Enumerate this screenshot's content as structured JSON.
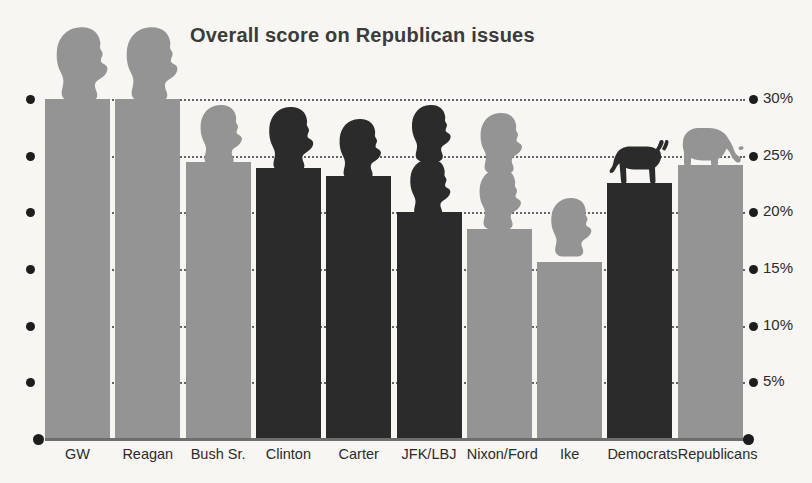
{
  "chart_data": {
    "type": "bar",
    "title": "Overall score on Republican issues",
    "xlabel": "",
    "ylabel": "",
    "ylim": [
      0,
      30
    ],
    "grid": true,
    "legend": "none",
    "ytick_labels": [
      "30%",
      "25%",
      "20%",
      "15%",
      "10%",
      "5%"
    ],
    "ytick_values": [
      30,
      25,
      20,
      15,
      10,
      5
    ],
    "categories": [
      "GW",
      "Reagan",
      "Bush Sr.",
      "Clinton",
      "Carter",
      "JFK/LBJ",
      "Nixon/Ford",
      "Ike",
      "Democrats",
      "Republicans"
    ],
    "values": [
      30.0,
      30.0,
      24.4,
      23.9,
      23.2,
      20.0,
      18.5,
      15.6,
      22.6,
      24.2
    ],
    "series": [
      {
        "name": "Overall score on Republican issues",
        "values": [
          30.0,
          30.0,
          24.4,
          23.9,
          23.2,
          20.0,
          18.5,
          15.6,
          22.6,
          24.2
        ]
      }
    ],
    "party_colors": [
      "republican",
      "republican",
      "republican",
      "democrat",
      "democrat",
      "democrat",
      "republican",
      "republican",
      "democrat",
      "republican"
    ],
    "colors": {
      "republican_bar": "#949494",
      "democrat_bar": "#2b2b2b",
      "background": "#f8f6f3",
      "title": "#3b3b3b",
      "axis": "#1d1d1d",
      "gridline": "#4a4a4a"
    },
    "annotations": [
      {
        "label": "GW presidential head silhouette",
        "category": "GW",
        "tone": "light"
      },
      {
        "label": "Reagan presidential head silhouette",
        "category": "Reagan",
        "tone": "light"
      },
      {
        "label": "Bush Sr. presidential head silhouette",
        "category": "Bush Sr.",
        "tone": "light"
      },
      {
        "label": "Clinton presidential head silhouette",
        "category": "Clinton",
        "tone": "dark"
      },
      {
        "label": "Carter presidential head silhouette",
        "category": "Carter",
        "tone": "dark"
      },
      {
        "label": "JFK presidential head silhouette",
        "category": "JFK/LBJ",
        "tone": "dark"
      },
      {
        "label": "LBJ presidential head silhouette",
        "category": "JFK/LBJ",
        "tone": "dark"
      },
      {
        "label": "Nixon presidential head silhouette",
        "category": "Nixon/Ford",
        "tone": "light"
      },
      {
        "label": "Ford presidential head silhouette",
        "category": "Nixon/Ford",
        "tone": "light"
      },
      {
        "label": "Ike presidential head silhouette",
        "category": "Ike",
        "tone": "light"
      },
      {
        "label": "Democratic donkey mascot",
        "category": "Democrats",
        "tone": "dark"
      },
      {
        "label": "Republican elephant mascot",
        "category": "Republicans",
        "tone": "light"
      }
    ]
  },
  "axis": {
    "ticks": [
      {
        "label": "30%",
        "value": 30
      },
      {
        "label": "25%",
        "value": 25
      },
      {
        "label": "20%",
        "value": 20
      },
      {
        "label": "15%",
        "value": 15
      },
      {
        "label": "10%",
        "value": 10
      },
      {
        "label": "5%",
        "value": 5
      }
    ]
  }
}
